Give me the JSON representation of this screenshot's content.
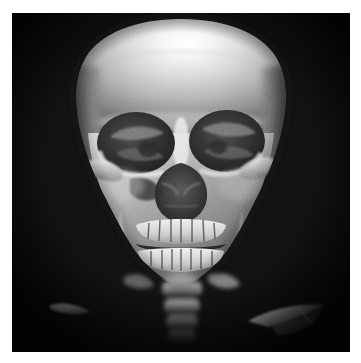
{
  "figure": {
    "domain_label": "medical-imaging",
    "modality": "CT",
    "rendering": "3D volume rendering",
    "view": "anterior (frontal)",
    "colormap": "grayscale",
    "background_color": "#121212",
    "page_margin_color": "#ffffff",
    "highlight_color": "#fbfbfb",
    "bone_midtone_color": "#9a9a9a",
    "bone_shadow_color": "#3a3a3a",
    "canvas": {
      "x": 12,
      "y": 13,
      "width": 338,
      "height": 339
    },
    "caption": "",
    "annotations": []
  },
  "anatomy": {
    "structures": [
      {
        "id": "frontal-bone",
        "label": "Frontal bone / calvarium",
        "brightness": "very bright",
        "note": "broad specular highlight upper-centre"
      },
      {
        "id": "right-orbit",
        "label": "Right orbital cavity",
        "brightness": "dark",
        "note": "viewer-left socket, disrupted rim"
      },
      {
        "id": "left-orbit",
        "label": "Left orbital cavity",
        "brightness": "dark",
        "note": "viewer-right socket"
      },
      {
        "id": "nasal-aperture",
        "label": "Piriform / nasal aperture",
        "brightness": "dark",
        "note": "turbinates visible inside"
      },
      {
        "id": "right-zygomatic-arch",
        "label": "Right zygomatic arch",
        "brightness": "bright",
        "note": "viewer-left lateral arch"
      },
      {
        "id": "left-zygomatic-arch",
        "label": "Left zygomatic arch",
        "brightness": "mid",
        "note": "viewer-right lateral arch"
      },
      {
        "id": "maxilla",
        "label": "Maxilla with upper dentition",
        "brightness": "bright",
        "note": ""
      },
      {
        "id": "mandible",
        "label": "Mandible with lower dentition",
        "brightness": "bright",
        "note": ""
      },
      {
        "id": "dental-arch",
        "label": "Upper and lower teeth rows",
        "brightness": "bright",
        "note": "occlusal line dark"
      },
      {
        "id": "cervical-spine",
        "label": "Cervical vertebrae",
        "brightness": "mid",
        "note": "below chin, fading into background"
      },
      {
        "id": "fragment-left",
        "label": "Bone fragment (lower left)",
        "brightness": "bright",
        "note": "small elongated sliver"
      },
      {
        "id": "fragment-right",
        "label": "Bone fragment (lower right)",
        "brightness": "bright",
        "note": "larger wing-shaped piece"
      }
    ]
  }
}
